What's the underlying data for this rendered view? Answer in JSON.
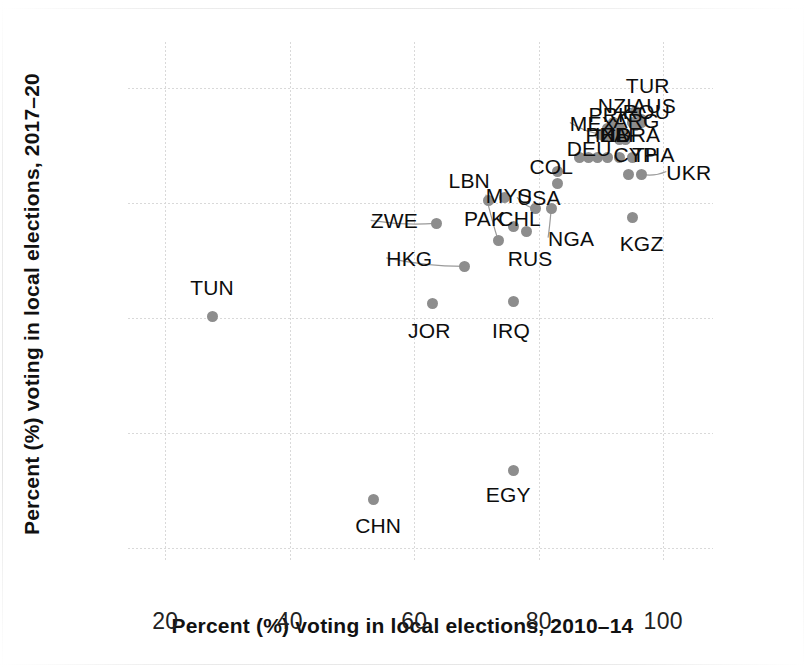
{
  "chart_data": {
    "type": "scatter",
    "title": "",
    "xlabel": "Percent (%) voting in local elections, 2010–14",
    "ylabel": "Percent (%) voting in local elections, 2017–20",
    "xlim": [
      14,
      108
    ],
    "ylim": [
      18,
      108
    ],
    "xticks": [
      20,
      40,
      60,
      80,
      100
    ],
    "yticks": [
      20,
      40,
      60,
      80,
      100
    ],
    "grid": true,
    "legend": "none",
    "marker_color": "#8d8d8d",
    "points": [
      {
        "label": "TUN",
        "x": 27.5,
        "y": 60.3,
        "lx": 24.0,
        "ly": 65.5,
        "leader": false
      },
      {
        "label": "CHN",
        "x": 53.5,
        "y": 28.5,
        "lx": 50.5,
        "ly": 24.0,
        "leader": false
      },
      {
        "label": "EGY",
        "x": 76.0,
        "y": 33.5,
        "lx": 71.5,
        "ly": 29.5,
        "leader": false
      },
      {
        "label": "JOR",
        "x": 63.0,
        "y": 62.5,
        "lx": 59.0,
        "ly": 58.0,
        "leader": false
      },
      {
        "label": "IRQ",
        "x": 76.0,
        "y": 63.0,
        "lx": 72.5,
        "ly": 58.0,
        "leader": false
      },
      {
        "label": "HKG",
        "x": 68.0,
        "y": 69.0,
        "lx": 55.5,
        "ly": 70.5,
        "leader": true
      },
      {
        "label": "ZWE",
        "x": 63.5,
        "y": 76.5,
        "lx": 53.0,
        "ly": 77.0,
        "leader": true
      },
      {
        "label": "MYS",
        "x": 73.5,
        "y": 73.5,
        "lx": 71.5,
        "ly": 81.5,
        "leader": true
      },
      {
        "label": "PAK",
        "x": 72.0,
        "y": 80.5,
        "lx": 68.0,
        "ly": 77.5,
        "leader": false
      },
      {
        "label": "LBN",
        "x": 74.5,
        "y": 81.0,
        "lx": 65.5,
        "ly": 84.0,
        "leader": false
      },
      {
        "label": "CHL",
        "x": 76.0,
        "y": 76.0,
        "lx": 73.5,
        "ly": 77.5,
        "leader": false
      },
      {
        "label": "RUS",
        "x": 78.0,
        "y": 75.0,
        "lx": 75.0,
        "ly": 70.5,
        "leader": false
      },
      {
        "label": "USA",
        "x": 79.5,
        "y": 79.0,
        "lx": 76.5,
        "ly": 81.0,
        "leader": true
      },
      {
        "label": "NGA",
        "x": 82.0,
        "y": 79.0,
        "lx": 81.5,
        "ly": 74.0,
        "leader": true
      },
      {
        "label": "COL",
        "x": 83.0,
        "y": 85.5,
        "lx": 78.5,
        "ly": 86.5,
        "leader": false
      },
      {
        "label": "DEU",
        "x": 88.0,
        "y": 88.0,
        "lx": 84.5,
        "ly": 89.5,
        "leader": false
      },
      {
        "label": "PHL",
        "x": 89.5,
        "y": 88.0,
        "lx": 87.5,
        "ly": 92.0,
        "leader": false
      },
      {
        "label": "MEX",
        "x": 90.0,
        "y": 92.0,
        "lx": 85.0,
        "ly": 94.0,
        "leader": true
      },
      {
        "label": "PRK",
        "x": 91.0,
        "y": 93.0,
        "lx": 88.0,
        "ly": 95.5,
        "leader": false
      },
      {
        "label": "NZL",
        "x": 92.0,
        "y": 94.0,
        "lx": 89.5,
        "ly": 97.0,
        "leader": false
      },
      {
        "label": "ARG",
        "x": 93.0,
        "y": 93.0,
        "lx": 92.0,
        "ly": 94.5,
        "leader": false
      },
      {
        "label": "IND",
        "x": 92.0,
        "y": 91.5,
        "lx": 89.0,
        "ly": 92.0,
        "leader": false
      },
      {
        "label": "ZAF",
        "x": 93.0,
        "y": 91.0,
        "lx": 90.0,
        "ly": 92.0,
        "leader": false
      },
      {
        "label": "BRA",
        "x": 94.0,
        "y": 91.0,
        "lx": 92.5,
        "ly": 92.0,
        "leader": false
      },
      {
        "label": "ROU",
        "x": 95.0,
        "y": 94.0,
        "lx": 93.5,
        "ly": 96.0,
        "leader": false
      },
      {
        "label": "AUS",
        "x": 96.5,
        "y": 94.5,
        "lx": 95.0,
        "ly": 97.0,
        "leader": false
      },
      {
        "label": "TUR",
        "x": 95.5,
        "y": 96.0,
        "lx": 94.0,
        "ly": 100.5,
        "leader": false
      },
      {
        "label": "CYP",
        "x": 93.0,
        "y": 88.0,
        "lx": 92.0,
        "ly": 88.5,
        "leader": false
      },
      {
        "label": "THA",
        "x": 95.0,
        "y": 88.0,
        "lx": 95.0,
        "ly": 88.5,
        "leader": false
      },
      {
        "label": "UKR",
        "x": 96.5,
        "y": 85.0,
        "lx": 100.5,
        "ly": 85.5,
        "leader": true
      },
      {
        "label": "KGZ",
        "x": 95.0,
        "y": 77.5,
        "lx": 93.0,
        "ly": 73.0,
        "leader": false
      }
    ],
    "extra_markers": [
      {
        "x": 86.5,
        "y": 88.0
      },
      {
        "x": 91.0,
        "y": 88.0
      },
      {
        "x": 94.5,
        "y": 85.0
      },
      {
        "x": 83.0,
        "y": 83.5
      },
      {
        "x": 90.5,
        "y": 91.5
      },
      {
        "x": 92.0,
        "y": 93.0
      },
      {
        "x": 93.5,
        "y": 92.0
      },
      {
        "x": 95.5,
        "y": 93.5
      },
      {
        "x": 96.5,
        "y": 94.0
      }
    ]
  }
}
